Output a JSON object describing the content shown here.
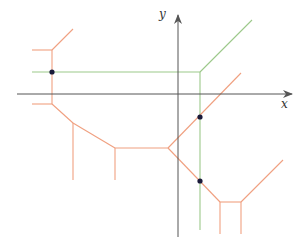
{
  "diagram": {
    "axes": {
      "x_label": "x",
      "y_label": "y",
      "color": "#555555",
      "x_axis": {
        "x1": 17,
        "y1": 94,
        "x2": 292,
        "y2": 94
      },
      "y_axis": {
        "x1": 178,
        "y1": 237,
        "x2": 178,
        "y2": 15
      },
      "x_label_pos": {
        "x": 281,
        "y": 108
      },
      "y_label_pos": {
        "x": 159,
        "y": 18
      }
    },
    "green_curve": {
      "color": "#9cc98a",
      "segments": [
        [
          32,
          72,
          200,
          72
        ],
        [
          200,
          72,
          200,
          230
        ],
        [
          200,
          72,
          252,
          20
        ]
      ]
    },
    "red_curve_left": {
      "color": "#f0a080",
      "segments": [
        [
          32,
          50,
          52,
          50
        ],
        [
          52,
          50,
          73,
          29
        ],
        [
          52,
          50,
          52,
          104
        ],
        [
          32,
          104,
          52,
          104
        ],
        [
          52,
          104,
          73,
          123
        ],
        [
          73,
          123,
          115,
          148
        ],
        [
          73,
          123,
          73,
          180
        ],
        [
          115,
          148,
          115,
          180
        ],
        [
          115,
          148,
          168,
          148
        ]
      ]
    },
    "red_curve_right": {
      "color": "#f0a080",
      "segments": [
        [
          168,
          148,
          241,
          73
        ],
        [
          168,
          148,
          220,
          202
        ],
        [
          220,
          202,
          241,
          202
        ],
        [
          241,
          202,
          283,
          160
        ],
        [
          220,
          202,
          220,
          234
        ],
        [
          241,
          202,
          241,
          234
        ]
      ]
    },
    "intersection_points": {
      "color": "#1a1a3a",
      "points": [
        {
          "x": 52,
          "y": 72
        },
        {
          "x": 200,
          "y": 117
        },
        {
          "x": 200,
          "y": 181
        }
      ]
    }
  }
}
